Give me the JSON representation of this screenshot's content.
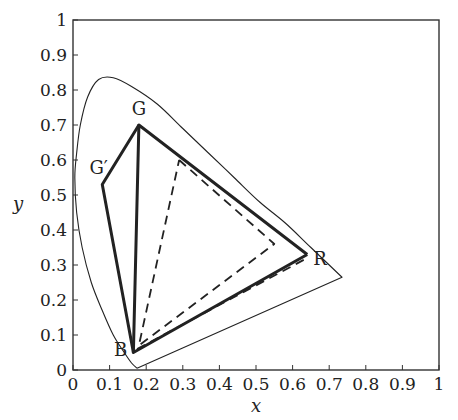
{
  "chart_data": {
    "type": "line",
    "title": "",
    "xlabel": "x",
    "ylabel": "y",
    "xlim": [
      0,
      1
    ],
    "ylim": [
      0,
      1
    ],
    "grid": false,
    "x_ticks": [
      "0",
      "0.1",
      "0.2",
      "0.3",
      "0.4",
      "0.5",
      "0.6",
      "0.7",
      "0.8",
      "0.9",
      "1"
    ],
    "y_ticks": [
      "0",
      "0.1",
      "0.2",
      "0.3",
      "0.4",
      "0.5",
      "0.6",
      "0.7",
      "0.8",
      "0.9",
      "1"
    ],
    "series": [
      {
        "name": "spectral locus",
        "style": "thin solid",
        "points": [
          [
            0.175,
            0.005
          ],
          [
            0.16,
            0.02
          ],
          [
            0.14,
            0.05
          ],
          [
            0.11,
            0.1
          ],
          [
            0.08,
            0.17
          ],
          [
            0.05,
            0.25
          ],
          [
            0.025,
            0.35
          ],
          [
            0.01,
            0.45
          ],
          [
            0.005,
            0.55
          ],
          [
            0.01,
            0.62
          ],
          [
            0.02,
            0.7
          ],
          [
            0.04,
            0.78
          ],
          [
            0.07,
            0.83
          ],
          [
            0.11,
            0.835
          ],
          [
            0.16,
            0.81
          ],
          [
            0.23,
            0.76
          ],
          [
            0.3,
            0.69
          ],
          [
            0.37,
            0.62
          ],
          [
            0.44,
            0.55
          ],
          [
            0.51,
            0.48
          ],
          [
            0.58,
            0.42
          ],
          [
            0.65,
            0.35
          ],
          [
            0.735,
            0.265
          ],
          [
            0.175,
            0.005
          ]
        ]
      },
      {
        "name": "gamut R-G-B",
        "style": "thick solid",
        "points": [
          [
            0.64,
            0.33
          ],
          [
            0.18,
            0.7
          ],
          [
            0.165,
            0.05
          ],
          [
            0.64,
            0.33
          ]
        ]
      },
      {
        "name": "gamut R-G'-B",
        "style": "thick solid",
        "points": [
          [
            0.18,
            0.7
          ],
          [
            0.08,
            0.53
          ],
          [
            0.165,
            0.05
          ]
        ]
      },
      {
        "name": "gamut dashed",
        "style": "dashed",
        "points": [
          [
            0.29,
            0.6
          ],
          [
            0.55,
            0.36
          ],
          [
            0.18,
            0.07
          ],
          [
            0.29,
            0.6
          ]
        ]
      },
      {
        "name": "dashed lower edge",
        "style": "dashed",
        "points": [
          [
            0.175,
            0.06
          ],
          [
            0.64,
            0.32
          ]
        ]
      }
    ],
    "annotations": [
      {
        "text": "G",
        "x": 0.18,
        "y": 0.73
      },
      {
        "text": "G′",
        "x": 0.07,
        "y": 0.56
      },
      {
        "text": "R",
        "x": 0.675,
        "y": 0.3
      },
      {
        "text": "B",
        "x": 0.13,
        "y": 0.04
      }
    ]
  }
}
